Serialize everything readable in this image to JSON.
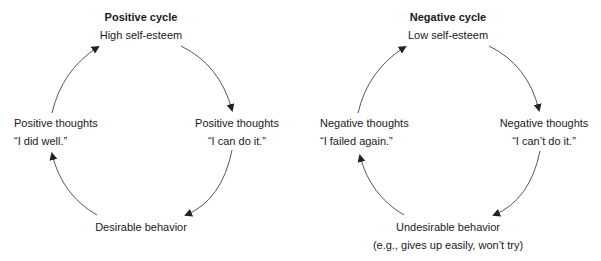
{
  "positive_cycle": {
    "title": "Positive cycle",
    "top": "High self-esteem",
    "right_line1": "Positive thoughts",
    "right_line2": "“I can do it.”",
    "bottom": "Desirable behavior",
    "left_line1": "Positive thoughts",
    "left_line2": "“I did well.”"
  },
  "negative_cycle": {
    "title": "Negative cycle",
    "top": "Low self-esteem",
    "right_line1": "Negative thoughts",
    "right_line2": "“I can’t do it.”",
    "bottom_line1": "Undesirable behavior",
    "bottom_line2": "(e.g., gives up easily, won’t try)",
    "left_line1": "Negative thoughts",
    "left_line2": "“I failed again.”"
  },
  "colors": {
    "text": "#1a1a1a",
    "arrow": "#333333",
    "background": "#ffffff"
  }
}
